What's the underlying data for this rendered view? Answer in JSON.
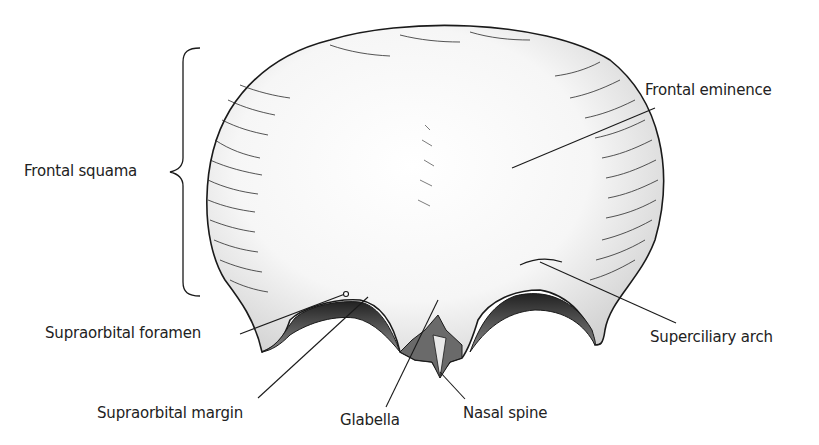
{
  "figure": {
    "colors": {
      "ink": "#1a1a1a",
      "bone_fill": "#f4f4f4",
      "shadow": "#d8d8d8",
      "dark": "#3a3a3a"
    }
  },
  "labels": {
    "frontal_squama": "Frontal squama",
    "frontal_eminence": "Frontal eminence",
    "supraorbital_foramen": "Supraorbital foramen",
    "superciliary_arch": "Superciliary arch",
    "supraorbital_margin": "Supraorbital margin",
    "glabella": "Glabella",
    "nasal_spine": "Nasal spine"
  }
}
